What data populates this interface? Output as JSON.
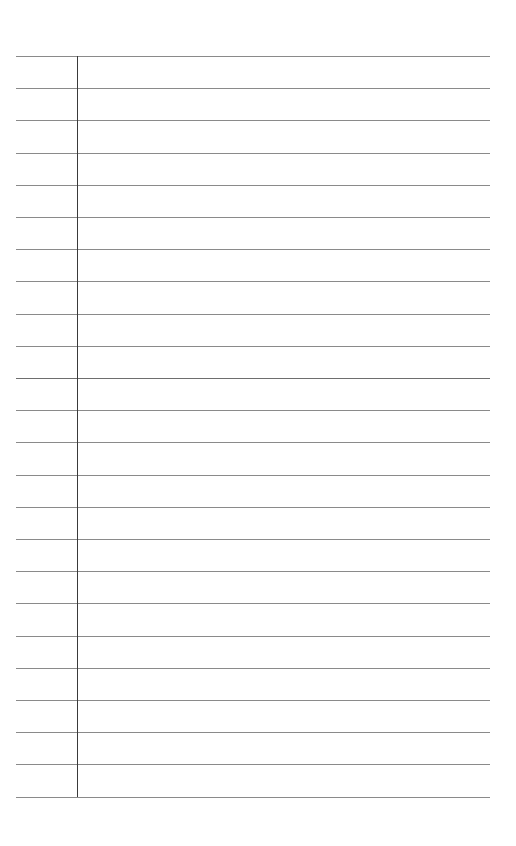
{
  "page": {
    "type": "lined-notebook-paper",
    "background_color": "#ffffff",
    "rule_color": "#8a8a8a",
    "margin_color": "#3a3a3a",
    "rule_count": 24,
    "rule_top": 56,
    "rule_spacing": 32.2,
    "rule_left": 16,
    "rule_width": 474,
    "margin_x": 77,
    "emphasized_rule_index": 10,
    "text_content": ""
  }
}
